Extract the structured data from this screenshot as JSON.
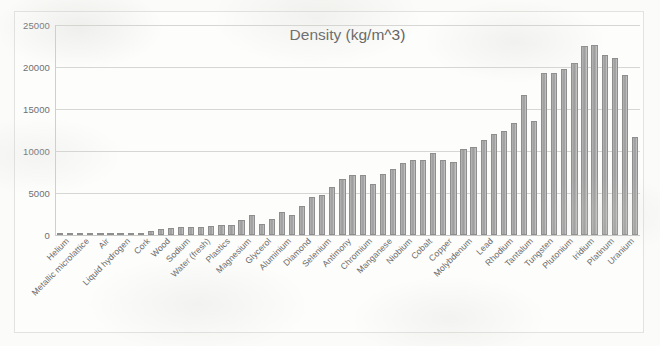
{
  "chart_data": {
    "type": "bar",
    "title": "Density (kg/m^3)",
    "xlabel": "",
    "ylabel": "",
    "ylim": [
      0,
      25000
    ],
    "yticks": [
      0,
      5000,
      10000,
      15000,
      20000,
      25000
    ],
    "ytick_labels": [
      "0",
      "5000",
      "10000",
      "15000",
      "20000",
      "25000"
    ],
    "grid": true,
    "legend": false,
    "bar_color": "#a6a6a6",
    "label_interval": 2,
    "categories": [
      "Helium",
      "Hydrogen",
      "Metallic microlattice",
      "Aerogel",
      "Air",
      "Styrofoam",
      "Liquid hydrogen",
      "Balsa wood",
      "Cork",
      "Lithium",
      "Wood",
      "Potassium",
      "Sodium",
      "Ice",
      "Water (fresh)",
      "Water (sea)",
      "Plastics",
      "Rubber",
      "Magnesium",
      "Concrete",
      "Glycerol",
      "Beryllium",
      "Aluminium",
      "Silicon",
      "Diamond",
      "Titanium",
      "Selenium",
      "Tin",
      "Antimony",
      "Zinc",
      "Chromium",
      "Vanadium",
      "Manganese",
      "Iron",
      "Niobium",
      "Nickel",
      "Cobalt",
      "Bismuth",
      "Copper",
      "Cadmium",
      "Molybdenum",
      "Silver",
      "Lead",
      "Palladium",
      "Rhodium",
      "Hafnium",
      "Tantalum",
      "Mercury",
      "Tungsten",
      "Gold",
      "Plutonium",
      "Neptunium",
      "Iridium",
      "Osmium",
      "Platinum",
      "Rhenium",
      "Uranium",
      "Thorium"
    ],
    "values": [
      0,
      0,
      1,
      2,
      1,
      50,
      71,
      160,
      240,
      534,
      700,
      862,
      968,
      917,
      1000,
      1025,
      1175,
      1250,
      1738,
      2400,
      1261,
      1850,
      2700,
      2330,
      3500,
      4500,
      4810,
      5765,
      6697,
      7140,
      7190,
      6110,
      7210,
      7874,
      8570,
      8908,
      8900,
      9780,
      8960,
      8650,
      10280,
      10490,
      11340,
      12023,
      12410,
      13310,
      16650,
      13534,
      19300,
      19320,
      19816,
      20450,
      22560,
      22590,
      21450,
      21020,
      19100,
      11700
    ],
    "visible_tick_labels": [
      "Helium",
      "Metallic microlattice",
      "Air",
      "Liquid hydrogen",
      "Cork",
      "Wood",
      "Sodium",
      "Water (fresh)",
      "Plastics",
      "Magnesium",
      "Glycerol",
      "Aluminium",
      "Diamond",
      "Selenium",
      "Antimony",
      "Chromium",
      "Manganese",
      "Niobium",
      "Cobalt",
      "Copper",
      "Molybdenum",
      "Lead",
      "Rhodium",
      "Tantalum",
      "Tungsten",
      "Plutonium",
      "Iridium"
    ],
    "bar_heights_px": [
      0.2,
      0.3,
      0.5,
      0.6,
      0.5,
      0.8,
      1.0,
      1.6,
      2.2,
      4.4,
      5.6,
      6.8,
      7.6,
      7.3,
      7.9,
      8.1,
      9.2,
      9.8,
      13.5,
      18.5,
      10.0,
      14.5,
      21.0,
      18.2,
      27.0,
      35.0,
      37.5,
      45.0,
      52.2,
      55.7,
      56.1,
      47.7,
      56.2,
      61.4,
      66.8,
      69.5,
      69.4,
      76.3,
      69.9,
      67.5,
      80.2,
      81.8,
      88.5,
      93.8,
      96.8,
      103.8,
      129.9,
      105.6,
      150.5,
      150.7,
      154.6,
      159.5,
      175.9,
      176.2,
      167.3,
      164.0,
      149.0,
      91.3
    ]
  }
}
